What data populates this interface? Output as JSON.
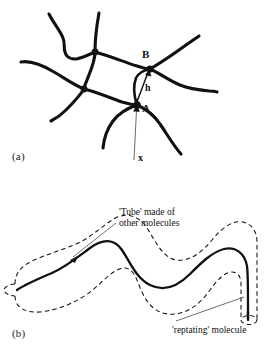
{
  "figure": {
    "panels": [
      {
        "id": "a",
        "label": "(a)",
        "description": "Crosslinked polymer network with junction points",
        "annotations": {
          "node_a": "A",
          "node_b": "B",
          "vector_h": "h",
          "vector_x": "x"
        }
      },
      {
        "id": "b",
        "label": "(b)",
        "description": "Reptation tube model of an entangled polymer chain",
        "annotations": {
          "tube_callout_line1": "'Tube' made of",
          "tube_callout_line2": "other molecules",
          "molecule_callout": "'reptating' molecule"
        }
      }
    ],
    "colors": {
      "background": "#ffffff",
      "ink": "#111111",
      "leader": "#4a4a4a",
      "thin_vector": "#6b6b6b"
    }
  }
}
